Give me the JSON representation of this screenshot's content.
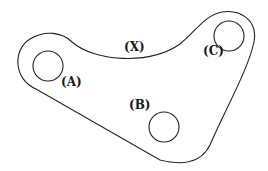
{
  "diagram": {
    "type": "mechanical-plate-outline",
    "stroke_color": "#222222",
    "background": "#ffffff",
    "labels": {
      "A": "(A)",
      "B": "(B)",
      "C": "(C)",
      "X": "(X)"
    },
    "holes": [
      {
        "id": "A",
        "cx": 48,
        "cy": 66,
        "r": 15
      },
      {
        "id": "B",
        "cx": 164,
        "cy": 127,
        "r": 15
      },
      {
        "id": "C",
        "cx": 229,
        "cy": 36,
        "r": 15
      }
    ]
  }
}
